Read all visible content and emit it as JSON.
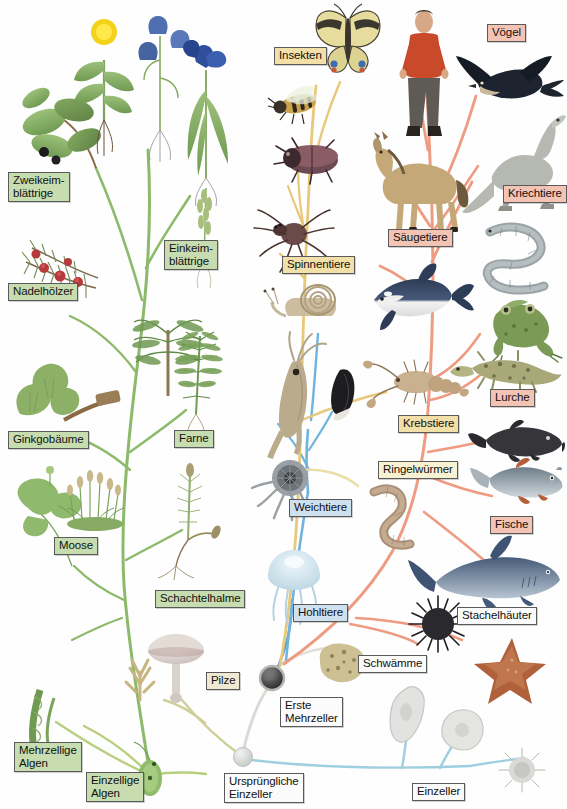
{
  "figure": {
    "root_label": "Ursprüngliche\nEinzeller",
    "colors": {
      "plant_branch": "#8cba6a",
      "algae_branch": "#b9cf7e",
      "mollusc_branch": "#6fb4de",
      "arthropod_branch": "#e8c87a",
      "vertebrate_branch": "#ef9b82",
      "protist_branch": "#9ecfe0",
      "fungi_branch": "#cfcf9a",
      "sponge_branch": "#ded8d4",
      "label_green": "#c7ddb0",
      "label_tan": "#f3dfa8",
      "label_cream": "#f7f3d2",
      "label_salmon": "#f3c3b4",
      "label_blue": "#cfe0ef",
      "label_beige": "#efe9d4",
      "label_white": "#fbfbfb"
    }
  },
  "labels": [
    {
      "id": "zweikeimblaettrige",
      "text": "Zweikeim-\nblättrige",
      "group": "plants",
      "color": "green",
      "x": 8,
      "y": 172
    },
    {
      "id": "einkeimblaettrige",
      "text": "Einkeim-\nblättrige",
      "group": "plants",
      "color": "green",
      "x": 164,
      "y": 240
    },
    {
      "id": "nadelhoelzer",
      "text": "Nadelhölzer",
      "group": "plants",
      "color": "green",
      "x": 8,
      "y": 283
    },
    {
      "id": "ginkgobaeume",
      "text": "Ginkgobäume",
      "group": "plants",
      "color": "green",
      "x": 8,
      "y": 431
    },
    {
      "id": "farne",
      "text": "Farne",
      "group": "plants",
      "color": "green",
      "x": 174,
      "y": 430
    },
    {
      "id": "moose",
      "text": "Moose",
      "group": "plants",
      "color": "green",
      "x": 54,
      "y": 537
    },
    {
      "id": "schachtelhalme",
      "text": "Schachtelhalme",
      "group": "plants",
      "color": "green",
      "x": 155,
      "y": 590
    },
    {
      "id": "mehrzellige-algen",
      "text": "Mehrzellige\nAlgen",
      "group": "algae",
      "color": "green",
      "x": 14,
      "y": 742
    },
    {
      "id": "einzellige-algen",
      "text": "Einzellige\nAlgen",
      "group": "algae",
      "color": "green",
      "x": 86,
      "y": 772
    },
    {
      "id": "pilze",
      "text": "Pilze",
      "group": "fungi",
      "color": "beige",
      "x": 206,
      "y": 672
    },
    {
      "id": "insekten",
      "text": "Insekten",
      "group": "arthropods",
      "color": "tan",
      "x": 274,
      "y": 47
    },
    {
      "id": "spinnentiere",
      "text": "Spinnentiere",
      "group": "arthropods",
      "color": "tan",
      "x": 282,
      "y": 256
    },
    {
      "id": "krebstiere",
      "text": "Krebstiere",
      "group": "arthropods",
      "color": "tan",
      "x": 398,
      "y": 415
    },
    {
      "id": "ringelwuermer",
      "text": "Ringelwürmer",
      "group": "annelids",
      "color": "cream",
      "x": 378,
      "y": 461
    },
    {
      "id": "weichtiere",
      "text": "Weichtiere",
      "group": "molluscs",
      "color": "blue",
      "x": 289,
      "y": 499
    },
    {
      "id": "hohltiere",
      "text": "Hohltiere",
      "group": "cnidarians",
      "color": "blue",
      "x": 293,
      "y": 604
    },
    {
      "id": "voegel",
      "text": "Vögel",
      "group": "vertebrates",
      "color": "salmon",
      "x": 487,
      "y": 24
    },
    {
      "id": "kriechtiere",
      "text": "Kriechtiere",
      "group": "vertebrates",
      "color": "salmon",
      "x": 503,
      "y": 185
    },
    {
      "id": "saeugetiere",
      "text": "Säugetiere",
      "group": "vertebrates",
      "color": "salmon",
      "x": 388,
      "y": 229
    },
    {
      "id": "lurche",
      "text": "Lurche",
      "group": "vertebrates",
      "color": "salmon",
      "x": 490,
      "y": 389
    },
    {
      "id": "fische",
      "text": "Fische",
      "group": "vertebrates",
      "color": "salmon",
      "x": 490,
      "y": 516
    },
    {
      "id": "stachelhaeuter",
      "text": "Stachelhäuter",
      "group": "echinoderms",
      "color": "white",
      "x": 457,
      "y": 607
    },
    {
      "id": "schwaemme",
      "text": "Schwämme",
      "group": "sponges",
      "color": "white",
      "x": 358,
      "y": 655
    },
    {
      "id": "erste-mehrzeller",
      "text": "Erste\nMehrzeller",
      "group": "root",
      "color": "white",
      "x": 280,
      "y": 697
    },
    {
      "id": "urspruengliche-einzeller",
      "text": "Ursprüngliche\nEinzeller",
      "group": "root",
      "color": "white",
      "x": 224,
      "y": 773
    },
    {
      "id": "einzeller",
      "text": "Einzeller",
      "group": "protists",
      "color": "white",
      "x": 412,
      "y": 783
    }
  ],
  "nodes": [
    {
      "id": "root-node",
      "name": "Ursprüngliche Einzeller",
      "x": 243,
      "y": 757,
      "r": 9,
      "fill": "#d6d9d6"
    },
    {
      "id": "first-multicellular-node",
      "name": "Erste Mehrzeller",
      "x": 272,
      "y": 678,
      "r": 11,
      "fill": "#4a4a4a"
    }
  ],
  "organisms": [
    {
      "id": "nightshade",
      "name": "Zweikeimblättrige Pflanze (Tollkirsche)",
      "x": 10,
      "y": 85
    },
    {
      "id": "dandelion",
      "name": "Löwenzahn",
      "x": 78,
      "y": 12
    },
    {
      "id": "bellflower",
      "name": "Glockenblume",
      "x": 138,
      "y": 12
    },
    {
      "id": "iris",
      "name": "Schwertlilie",
      "x": 175,
      "y": 42
    },
    {
      "id": "grass",
      "name": "Gras / Ähre",
      "x": 185,
      "y": 175
    },
    {
      "id": "yew",
      "name": "Eibenzweig",
      "x": 18,
      "y": 222
    },
    {
      "id": "ginkgo",
      "name": "Ginkgoblatt",
      "x": 10,
      "y": 370
    },
    {
      "id": "palmfern",
      "name": "Palmfarn",
      "x": 150,
      "y": 318
    },
    {
      "id": "fern",
      "name": "Farnwedel",
      "x": 182,
      "y": 330
    },
    {
      "id": "liverwort",
      "name": "Lebermoos",
      "x": 26,
      "y": 492
    },
    {
      "id": "moss",
      "name": "Laubmoos",
      "x": 78,
      "y": 470
    },
    {
      "id": "horsetail",
      "name": "Schachtelhalm",
      "x": 170,
      "y": 482
    },
    {
      "id": "mushroom",
      "name": "Pilz",
      "x": 158,
      "y": 635
    },
    {
      "id": "coral-fungus",
      "name": "Korallenpilz",
      "x": 128,
      "y": 645
    },
    {
      "id": "green-alga",
      "name": "Vielzellige Alge",
      "x": 18,
      "y": 690
    },
    {
      "id": "euglena",
      "name": "Einzellige Alge",
      "x": 137,
      "y": 765
    },
    {
      "id": "butterfly",
      "name": "Schmetterling",
      "x": 325,
      "y": 10
    },
    {
      "id": "bee",
      "name": "Biene",
      "x": 278,
      "y": 82
    },
    {
      "id": "beetle",
      "name": "Käfer",
      "x": 288,
      "y": 138
    },
    {
      "id": "spider",
      "name": "Spinne",
      "x": 280,
      "y": 214
    },
    {
      "id": "snail",
      "name": "Schnecke",
      "x": 288,
      "y": 288
    },
    {
      "id": "squid",
      "name": "Tintenfisch",
      "x": 286,
      "y": 352
    },
    {
      "id": "mussel",
      "name": "Muschel",
      "x": 333,
      "y": 368
    },
    {
      "id": "octopus",
      "name": "Kopffüßer",
      "x": 276,
      "y": 472
    },
    {
      "id": "lobster",
      "name": "Hummer",
      "x": 380,
      "y": 368
    },
    {
      "id": "earthworm",
      "name": "Regenwurm",
      "x": 364,
      "y": 482
    },
    {
      "id": "jellyfish",
      "name": "Qualle",
      "x": 270,
      "y": 548
    },
    {
      "id": "human",
      "name": "Mensch",
      "x": 400,
      "y": 8
    },
    {
      "id": "horse",
      "name": "Pferd",
      "x": 378,
      "y": 152
    },
    {
      "id": "orca",
      "name": "Orca / Delfin",
      "x": 378,
      "y": 262
    },
    {
      "id": "swallow",
      "name": "Schwalbe",
      "x": 480,
      "y": 58
    },
    {
      "id": "dinosaur",
      "name": "Reptil / Saurier",
      "x": 488,
      "y": 128
    },
    {
      "id": "snake",
      "name": "Schlange",
      "x": 490,
      "y": 225
    },
    {
      "id": "frog",
      "name": "Frosch",
      "x": 492,
      "y": 302
    },
    {
      "id": "salamander",
      "name": "Molch",
      "x": 470,
      "y": 355
    },
    {
      "id": "coelacanth",
      "name": "Quastenflosser",
      "x": 484,
      "y": 428
    },
    {
      "id": "bony-fish",
      "name": "Knochenfisch",
      "x": 480,
      "y": 468
    },
    {
      "id": "shark",
      "name": "Hai",
      "x": 430,
      "y": 548
    },
    {
      "id": "sea-urchin",
      "name": "Seeigel",
      "x": 420,
      "y": 608
    },
    {
      "id": "starfish",
      "name": "Seestern",
      "x": 482,
      "y": 640
    },
    {
      "id": "sponge",
      "name": "Schwamm",
      "x": 318,
      "y": 648
    },
    {
      "id": "amoeba-1",
      "name": "Amöbe",
      "x": 398,
      "y": 688
    },
    {
      "id": "amoeba-2",
      "name": "Amöbe",
      "x": 448,
      "y": 712
    },
    {
      "id": "radiolarian",
      "name": "Strahlentierchen",
      "x": 510,
      "y": 752
    }
  ],
  "branches": {
    "plant_trunk": "Pflanzenstamm (grün)",
    "mollusc": "Weichtiere (blau)",
    "arthropod": "Gliederfüßer (gelb)",
    "vertebrate": "Wirbeltiere (lachsfarben)",
    "protist": "Einzeller (hellblau)"
  }
}
